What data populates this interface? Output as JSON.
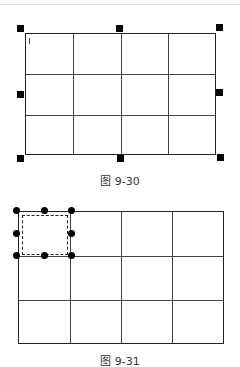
{
  "figures": [
    {
      "id": "fig1",
      "caption": "图 9-30",
      "description": "Table with 3 rows x 4 columns fully selected; 8 square selection handles around border"
    },
    {
      "id": "fig2",
      "caption": "图 9-31",
      "description": "Table with 3 rows x 4 columns; top-left cell selected with dashed border and 8 round handles"
    }
  ],
  "table": {
    "rows": 3,
    "cols": 4
  }
}
